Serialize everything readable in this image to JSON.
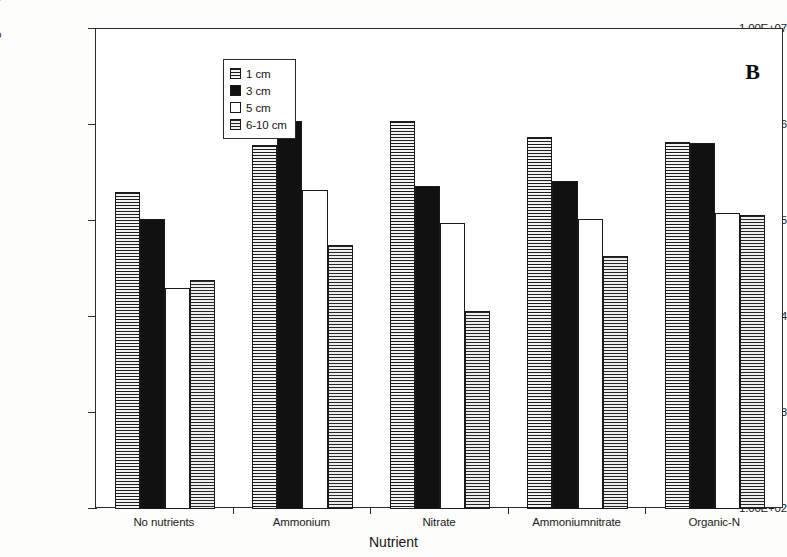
{
  "panel": {
    "label": "B"
  },
  "chart_data": {
    "type": "bar",
    "title": "",
    "panel_label": "B",
    "xlabel": "Nutrient",
    "ylabel": "Oil-degrading bacteria (cells/g sediment)",
    "yscale": "log",
    "ylim": [
      100,
      10000000
    ],
    "ytick_labels": [
      "1.00E+07",
      "1.00E+06",
      "1.00E+05",
      "1.00E+04",
      "1.00E+03",
      "1.00E+02"
    ],
    "ytick_values": [
      10000000,
      1000000,
      100000,
      10000,
      1000,
      100
    ],
    "grid": false,
    "legend_position": "top-left",
    "categories": [
      "No nutrients",
      "Ammonium",
      "Nitrate",
      "Ammoniumnitrate",
      "Organic-N"
    ],
    "series": [
      {
        "name": "1 cm",
        "pattern": "horizontal-lines",
        "values": [
          200000,
          620000,
          1100000,
          750000,
          670000
        ]
      },
      {
        "name": "3 cm",
        "pattern": "solid-black",
        "values": [
          105000,
          1100000,
          230000,
          260000,
          650000
        ]
      },
      {
        "name": "5 cm",
        "pattern": "empty-white",
        "values": [
          20000,
          210000,
          95000,
          105000,
          120000
        ]
      },
      {
        "name": "6-10 cm",
        "pattern": "cross-hatch-grid",
        "values": [
          24000,
          56000,
          11500,
          43000,
          115000
        ]
      }
    ]
  },
  "legend": {
    "items": [
      {
        "label": "1 cm"
      },
      {
        "label": "3 cm"
      },
      {
        "label": "5 cm"
      },
      {
        "label": "6-10 cm"
      }
    ]
  },
  "colors": {
    "axis": "#2b2b2b",
    "bar_outline": "#1a1a1a",
    "solid_fill": "#111111",
    "background": "#ffffff"
  }
}
